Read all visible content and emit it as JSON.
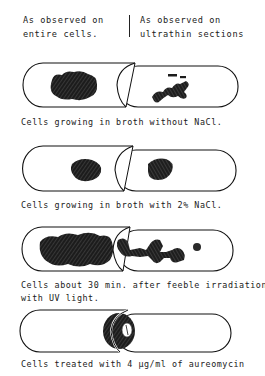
{
  "header": {
    "left_line1": "As observed on",
    "left_line2": "entire cells.",
    "right_line1": "As observed on",
    "right_line2": "ultrathin sections"
  },
  "panels": [
    {
      "id": "no-nacl",
      "caption": "Cells growing in broth without NaCl.",
      "left_view": "large irregular nucleoid mass",
      "right_view": "branched irregular nucleoid"
    },
    {
      "id": "nacl-2pct",
      "caption": "Cells growing in broth with 2% NaCl.",
      "left_view": "compact rounded nucleoid",
      "right_view": "compact rounded nucleoid"
    },
    {
      "id": "uv",
      "caption_line1": "Cells about 30 min. after feeble irradiation",
      "caption_line2": "with UV light.",
      "left_view": "extended elongated nucleoid mass",
      "right_view": "elongated fragmented nucleoid"
    },
    {
      "id": "aureomycin",
      "caption": "Cells treated with 4 µg/ml of aureomycin",
      "view": "ring-shaped nucleoid"
    }
  ],
  "colors": {
    "ink": "#111111",
    "background": "#ffffff"
  }
}
